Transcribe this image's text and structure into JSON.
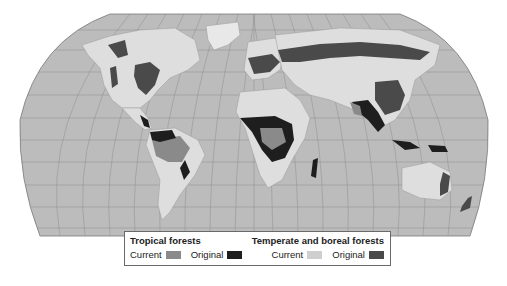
{
  "map": {
    "projection": "Robinson world map",
    "colors": {
      "ocean": "#bcbcbc",
      "land": "#dedede",
      "graticule": "#8e8e8e",
      "border": "#9a9a9a",
      "tropical_current": "#8a8a8a",
      "tropical_original": "#1e1e1e",
      "temperate_current": "#cfcfcf",
      "temperate_original": "#4a4a4a"
    }
  },
  "legend": {
    "tropical": {
      "title": "Tropical forests",
      "current_label": "Current",
      "original_label": "Original"
    },
    "temperate": {
      "title": "Temperate and boreal forests",
      "current_label": "Current",
      "original_label": "Original"
    }
  }
}
